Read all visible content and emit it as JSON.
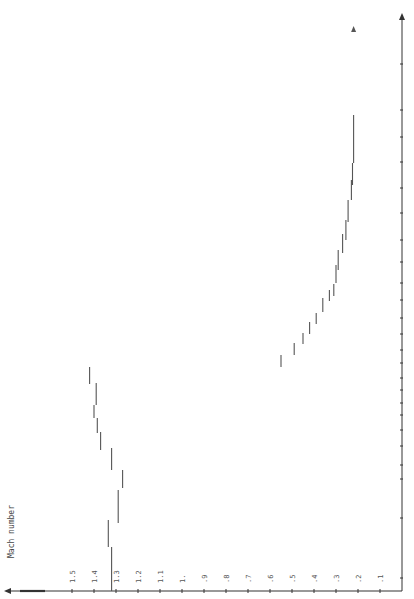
{
  "chart_data": {
    "type": "line",
    "orientation": "rotated-90-ccw",
    "title": "",
    "ylabel": "Mach number",
    "xlabel": "",
    "y_ticks": [
      "1.5",
      "1.4",
      "1.3",
      "1.2",
      "1.1",
      "1.",
      ".9",
      ".8",
      ".7",
      ".6",
      ".5",
      ".4",
      ".3",
      ".2",
      ".1"
    ],
    "y_tick_values": [
      1.5,
      1.4,
      1.3,
      1.2,
      1.1,
      1.0,
      0.9,
      0.8,
      0.7,
      0.6,
      0.5,
      0.4,
      0.3,
      0.2,
      0.1
    ],
    "ylim": [
      0,
      1.8
    ],
    "grid": false,
    "series": [
      {
        "name": "supersonic branch",
        "style": "step",
        "segments": [
          {
            "mach": 1.32,
            "from": 0,
            "to": 1
          },
          {
            "mach": 1.335,
            "from": 1,
            "to": 2
          },
          {
            "mach": 1.29,
            "from": 2,
            "to": 3
          },
          {
            "mach": 1.27,
            "from": 3,
            "to": 4
          },
          {
            "mach": 1.32,
            "from": 4,
            "to": 5
          },
          {
            "mach": 1.37,
            "from": 5,
            "to": 6
          },
          {
            "mach": 1.385,
            "from": 6,
            "to": 7
          },
          {
            "mach": 1.4,
            "from": 7,
            "to": 8
          },
          {
            "mach": 1.39,
            "from": 8,
            "to": 9
          },
          {
            "mach": 1.39,
            "from": 9,
            "to": 10
          },
          {
            "mach": 1.42,
            "from": 10,
            "to": 11
          }
        ]
      },
      {
        "name": "subsonic branch",
        "style": "step",
        "segments": [
          {
            "mach": 0.55,
            "from": 11,
            "to": 12
          },
          {
            "mach": 0.49,
            "from": 12,
            "to": 13
          },
          {
            "mach": 0.45,
            "from": 13,
            "to": 14
          },
          {
            "mach": 0.42,
            "from": 14,
            "to": 15
          },
          {
            "mach": 0.39,
            "from": 15,
            "to": 16
          },
          {
            "mach": 0.36,
            "from": 16,
            "to": 17
          },
          {
            "mach": 0.33,
            "from": 17,
            "to": 18
          },
          {
            "mach": 0.31,
            "from": 18,
            "to": 19
          },
          {
            "mach": 0.3,
            "from": 19,
            "to": 20
          },
          {
            "mach": 0.29,
            "from": 20,
            "to": 21
          },
          {
            "mach": 0.27,
            "from": 21,
            "to": 22
          },
          {
            "mach": 0.255,
            "from": 22,
            "to": 23
          },
          {
            "mach": 0.245,
            "from": 23,
            "to": 24
          },
          {
            "mach": 0.23,
            "from": 24,
            "to": 25
          },
          {
            "mach": 0.225,
            "from": 25,
            "to": 26
          },
          {
            "mach": 0.22,
            "from": 26,
            "to": 27
          },
          {
            "mach": 0.22,
            "from": 27,
            "to": 28
          }
        ]
      }
    ],
    "legend": null
  },
  "render": {
    "axis_color": "#333333",
    "line_color": "#555555",
    "mach_zero_px": 402,
    "px_per_mach": 220,
    "baseline_y": 591,
    "segment_px": [
      [
        591,
        547
      ],
      [
        547,
        520
      ],
      [
        523,
        490
      ],
      [
        488,
        470
      ],
      [
        470,
        448
      ],
      [
        450,
        432
      ],
      [
        433,
        418
      ],
      [
        418,
        405
      ],
      [
        405,
        398
      ],
      [
        398,
        383
      ],
      [
        384,
        367
      ],
      [
        367,
        355
      ],
      [
        355,
        343
      ],
      [
        344,
        333
      ],
      [
        334,
        322
      ],
      [
        324,
        313
      ],
      [
        312,
        298
      ],
      [
        301,
        290
      ],
      [
        296,
        284
      ],
      [
        283,
        265
      ],
      [
        270,
        250
      ],
      [
        253,
        234
      ],
      [
        240,
        220
      ],
      [
        222,
        200
      ],
      [
        200,
        180
      ],
      [
        185,
        163
      ],
      [
        163,
        140
      ],
      [
        140,
        115
      ],
      [
        113,
        75
      ],
      [
        73,
        30
      ]
    ],
    "right_axis_ticks_y": [
      64,
      110,
      137,
      162,
      188,
      213,
      240,
      262,
      283,
      300,
      318,
      334,
      350,
      363,
      378,
      390,
      403,
      415,
      430,
      446,
      465,
      479,
      518,
      578
    ]
  }
}
